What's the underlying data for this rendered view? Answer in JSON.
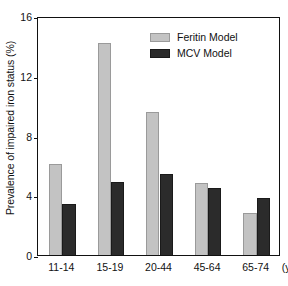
{
  "chart_data": {
    "type": "bar",
    "title": "",
    "subtitle": "",
    "xlabel": "",
    "xlabel_unit": "(y)",
    "ylabel": "Prevalence of impaired iron status (%)",
    "categories": [
      "11-14",
      "15-19",
      "20-44",
      "45-64",
      "65-74"
    ],
    "series": [
      {
        "name": "Feritin Model",
        "color": "#c3c3c3",
        "values": [
          6.1,
          14.2,
          9.6,
          4.8,
          2.8
        ]
      },
      {
        "name": "MCV Model",
        "color": "#2b2b2b",
        "values": [
          3.4,
          4.9,
          5.4,
          4.5,
          3.8
        ]
      }
    ],
    "ylim": [
      0,
      16
    ],
    "yticks": [
      0,
      4,
      8,
      12,
      16
    ],
    "ytick_labels": [
      "0",
      "4",
      "8",
      "12",
      "16"
    ],
    "grid": false,
    "legend_position": "top-right",
    "bar_group_gap": 0.45,
    "frame": true
  },
  "legend": {
    "entries": [
      {
        "label": "Feritin Model",
        "swatch": "light-gray-swatch"
      },
      {
        "label": "MCV Model",
        "swatch": "dark-swatch"
      }
    ]
  },
  "colors": {
    "series_feritin": "#c3c3c3",
    "series_mcv": "#2b2b2b",
    "axis": "#111111",
    "background": "#ffffff"
  }
}
